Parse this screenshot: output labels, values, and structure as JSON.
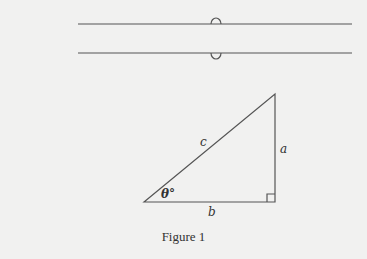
{
  "diagram": {
    "labels": {
      "hypotenuse": "c",
      "vertical_leg": "a",
      "horizontal_leg": "b",
      "angle": "θ°"
    },
    "caption": "Figure 1"
  }
}
